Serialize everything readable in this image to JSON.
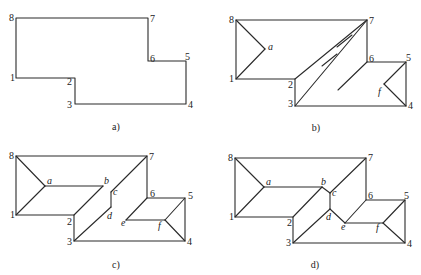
{
  "figure": {
    "panels": [
      {
        "id": "a",
        "caption": "a)",
        "caption_pos": [
          116,
          130
        ],
        "outline": [
          [
            16,
            18
          ],
          [
            148,
            18
          ],
          [
            148,
            61
          ],
          [
            186,
            61
          ],
          [
            186,
            104
          ],
          [
            75,
            104
          ],
          [
            75,
            78
          ],
          [
            16,
            78
          ]
        ],
        "segments": [],
        "vertex_labels": [
          {
            "t": "8",
            "x": 9,
            "y": 21
          },
          {
            "t": "7",
            "x": 150,
            "y": 22
          },
          {
            "t": "6",
            "x": 150,
            "y": 62
          },
          {
            "t": "5",
            "x": 185,
            "y": 60
          },
          {
            "t": "4",
            "x": 188,
            "y": 108
          },
          {
            "t": "3",
            "x": 67,
            "y": 108
          },
          {
            "t": "2",
            "x": 67,
            "y": 85
          },
          {
            "t": "1",
            "x": 10,
            "y": 81
          }
        ],
        "point_labels": []
      },
      {
        "id": "b",
        "caption": "b)",
        "caption_pos": [
          316,
          131
        ],
        "outline": [
          [
            236,
            20
          ],
          [
            367,
            20
          ],
          [
            367,
            62
          ],
          [
            406,
            62
          ],
          [
            406,
            106
          ],
          [
            295,
            106
          ],
          [
            295,
            79
          ],
          [
            236,
            79
          ]
        ],
        "segments": [
          [
            [
              236,
              20
            ],
            [
              265,
              49
            ]
          ],
          [
            [
              265,
              49
            ],
            [
              236,
              79
            ]
          ],
          [
            [
              295,
              79
            ],
            [
              367,
              20
            ]
          ],
          [
            [
              295,
              106
            ],
            [
              367,
              20
            ]
          ],
          [
            [
              322,
              66
            ],
            [
              337,
              54
            ]
          ],
          [
            [
              337,
              47
            ],
            [
              352,
              35
            ]
          ],
          [
            [
              338,
              90
            ],
            [
              367,
              62
            ]
          ],
          [
            [
              406,
              62
            ],
            [
              384,
              84
            ]
          ],
          [
            [
              384,
              84
            ],
            [
              406,
              106
            ]
          ]
        ],
        "vertex_labels": [
          {
            "t": "8",
            "x": 229,
            "y": 23
          },
          {
            "t": "7",
            "x": 369,
            "y": 24
          },
          {
            "t": "6",
            "x": 369,
            "y": 62
          },
          {
            "t": "5",
            "x": 406,
            "y": 61
          },
          {
            "t": "4",
            "x": 408,
            "y": 109
          },
          {
            "t": "3",
            "x": 288,
            "y": 107
          },
          {
            "t": "2",
            "x": 288,
            "y": 88
          },
          {
            "t": "1",
            "x": 229,
            "y": 82
          }
        ],
        "point_labels": [
          {
            "t": "a",
            "x": 268,
            "y": 50
          },
          {
            "t": "f",
            "x": 378,
            "y": 95
          }
        ]
      },
      {
        "id": "c",
        "caption": "c)",
        "caption_pos": [
          116,
          268
        ],
        "outline": [
          [
            16,
            156
          ],
          [
            147,
            156
          ],
          [
            147,
            198
          ],
          [
            185,
            198
          ],
          [
            185,
            241
          ],
          [
            74,
            241
          ],
          [
            74,
            215
          ],
          [
            16,
            215
          ]
        ],
        "segments": [
          [
            [
              16,
              156
            ],
            [
              45,
              186
            ]
          ],
          [
            [
              16,
              215
            ],
            [
              45,
              186
            ]
          ],
          [
            [
              45,
              186
            ],
            [
              103,
              186
            ]
          ],
          [
            [
              74,
              215
            ],
            [
              103,
              186
            ]
          ],
          [
            [
              147,
              156
            ],
            [
              111,
              192
            ]
          ],
          [
            [
              111,
              192
            ],
            [
              111,
              207
            ]
          ],
          [
            [
              111,
              207
            ],
            [
              74,
              241
            ]
          ],
          [
            [
              147,
              198
            ],
            [
              126,
              220
            ]
          ],
          [
            [
              126,
              220
            ],
            [
              165,
              220
            ]
          ],
          [
            [
              185,
              198
            ],
            [
              165,
              220
            ]
          ],
          [
            [
              165,
              220
            ],
            [
              185,
              241
            ]
          ]
        ],
        "vertex_labels": [
          {
            "t": "8",
            "x": 9,
            "y": 159
          },
          {
            "t": "7",
            "x": 149,
            "y": 160
          },
          {
            "t": "6",
            "x": 150,
            "y": 197
          },
          {
            "t": "5",
            "x": 188,
            "y": 199
          },
          {
            "t": "4",
            "x": 187,
            "y": 245
          },
          {
            "t": "3",
            "x": 67,
            "y": 245
          },
          {
            "t": "2",
            "x": 67,
            "y": 225
          },
          {
            "t": "1",
            "x": 10,
            "y": 218
          }
        ],
        "point_labels": [
          {
            "t": "a",
            "x": 47,
            "y": 184
          },
          {
            "t": "b",
            "x": 104,
            "y": 184
          },
          {
            "t": "c",
            "x": 113,
            "y": 195
          },
          {
            "t": "d",
            "x": 107,
            "y": 219
          },
          {
            "t": "e",
            "x": 121,
            "y": 226
          },
          {
            "t": "f",
            "x": 158,
            "y": 229
          }
        ]
      },
      {
        "id": "d",
        "caption": "d)",
        "caption_pos": [
          315,
          268
        ],
        "outline": [
          [
            235,
            158
          ],
          [
            366,
            158
          ],
          [
            366,
            200
          ],
          [
            405,
            200
          ],
          [
            405,
            243
          ],
          [
            293,
            243
          ],
          [
            293,
            217
          ],
          [
            235,
            217
          ]
        ],
        "segments": [
          [
            [
              235,
              158
            ],
            [
              264,
              187
            ]
          ],
          [
            [
              235,
              217
            ],
            [
              264,
              187
            ]
          ],
          [
            [
              264,
              187
            ],
            [
              322,
              187
            ]
          ],
          [
            [
              293,
              217
            ],
            [
              322,
              187
            ]
          ],
          [
            [
              322,
              187
            ],
            [
              330,
              193
            ]
          ],
          [
            [
              366,
              158
            ],
            [
              330,
              193
            ]
          ],
          [
            [
              330,
              193
            ],
            [
              330,
              209
            ]
          ],
          [
            [
              330,
              209
            ],
            [
              293,
              243
            ]
          ],
          [
            [
              330,
              209
            ],
            [
              345,
              223
            ]
          ],
          [
            [
              366,
              200
            ],
            [
              345,
              223
            ]
          ],
          [
            [
              345,
              223
            ],
            [
              383,
              223
            ]
          ],
          [
            [
              405,
              200
            ],
            [
              383,
              223
            ]
          ],
          [
            [
              383,
              223
            ],
            [
              405,
              243
            ]
          ]
        ],
        "vertex_labels": [
          {
            "t": "8",
            "x": 228,
            "y": 161
          },
          {
            "t": "7",
            "x": 368,
            "y": 161
          },
          {
            "t": "6",
            "x": 368,
            "y": 199
          },
          {
            "t": "5",
            "x": 404,
            "y": 199
          },
          {
            "t": "4",
            "x": 407,
            "y": 247
          },
          {
            "t": "3",
            "x": 286,
            "y": 246
          },
          {
            "t": "2",
            "x": 287,
            "y": 226
          },
          {
            "t": "1",
            "x": 229,
            "y": 220
          }
        ],
        "point_labels": [
          {
            "t": "a",
            "x": 266,
            "y": 185
          },
          {
            "t": "b",
            "x": 321,
            "y": 185
          },
          {
            "t": "c",
            "x": 332,
            "y": 196
          },
          {
            "t": "d",
            "x": 326,
            "y": 220
          },
          {
            "t": "e",
            "x": 341,
            "y": 230
          },
          {
            "t": "f",
            "x": 376,
            "y": 231
          }
        ]
      }
    ]
  }
}
